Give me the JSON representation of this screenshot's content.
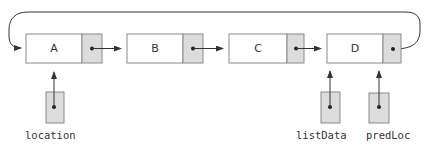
{
  "caption": {
    "text": "(b) Deleting the last node (clipped)",
    "visible": "clipped, unreadable"
  },
  "colors": {
    "box_stroke": "#8a8a8a",
    "info_fill": "#ffffff",
    "pointer_fill": "#dcdcdc",
    "line": "#333333",
    "text": "#333333"
  },
  "list": {
    "type": "circular singly linked list",
    "nodes": [
      {
        "info": "A",
        "next": "B"
      },
      {
        "info": "B",
        "next": "C"
      },
      {
        "info": "C",
        "next": "D"
      },
      {
        "info": "D",
        "next": "A"
      }
    ]
  },
  "pointers": [
    {
      "name": "location",
      "points_to": "A"
    },
    {
      "name": "listData",
      "points_to": "D"
    },
    {
      "name": "predLoc",
      "points_to": "D"
    }
  ]
}
